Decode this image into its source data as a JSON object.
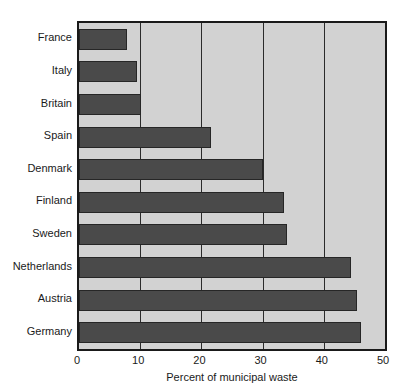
{
  "chart_data": {
    "type": "bar",
    "orientation": "horizontal",
    "title": "",
    "subtitle": "",
    "xlabel": "Percent of municipal waste",
    "ylabel": "",
    "categories": [
      "France",
      "Italy",
      "Britain",
      "Spain",
      "Denmark",
      "Finland",
      "Sweden",
      "Netherlands",
      "Austria",
      "Germany"
    ],
    "values": [
      7.8,
      9.4,
      10.2,
      21.5,
      30.0,
      33.5,
      34.0,
      44.5,
      45.5,
      46.0
    ],
    "xlim": [
      0,
      50
    ],
    "xticks": [
      0,
      10,
      20,
      30,
      40,
      50
    ],
    "xtick_labels": [
      "0",
      "10",
      "20",
      "30",
      "40",
      "50"
    ],
    "grid": "vertical",
    "legend": "none",
    "colors": {
      "bar_fill": "#4a4a4a",
      "bar_stroke": "#262626",
      "plot_background": "#d2d2d2",
      "plot_border": "#1a1a1a",
      "gridline": "#2b2b2b",
      "text": "#1a1a1a",
      "page_background": "#ffffff"
    }
  }
}
